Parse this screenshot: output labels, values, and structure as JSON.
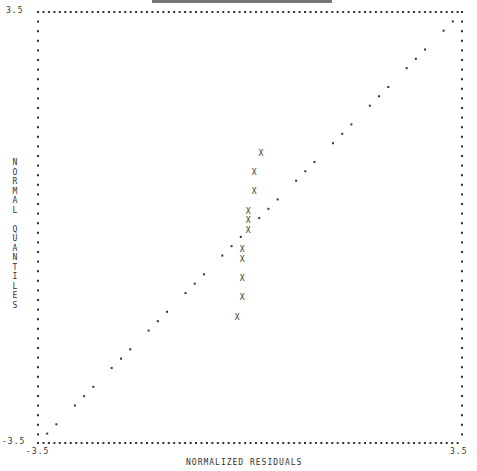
{
  "chart_data": {
    "type": "scatter",
    "title": "",
    "xlabel": "NORMALIZED RESIDUALS",
    "ylabel": "NORMAL QUANTILES",
    "xlim": [
      -3.5,
      3.5
    ],
    "ylim": [
      -3.5,
      3.5
    ],
    "grid": false,
    "legend": null,
    "tick_labels": {
      "y_top": "3.5",
      "y_bottom": "-3.5",
      "x_left": "-3.5",
      "x_right": "3.5"
    },
    "series": [
      {
        "name": "residuals",
        "marker": "X",
        "points": [
          {
            "x": 0.18,
            "y": 1.21
          },
          {
            "x": 0.07,
            "y": 0.9
          },
          {
            "x": 0.07,
            "y": 0.59
          },
          {
            "x": -0.03,
            "y": 0.27
          },
          {
            "x": -0.03,
            "y": 0.12
          },
          {
            "x": -0.03,
            "y": -0.04
          },
          {
            "x": -0.13,
            "y": -0.35
          },
          {
            "x": -0.13,
            "y": -0.51
          },
          {
            "x": -0.13,
            "y": -0.82
          },
          {
            "x": -0.13,
            "y": -1.13
          },
          {
            "x": -0.21,
            "y": -1.45
          }
        ]
      },
      {
        "name": "reference line y=x",
        "marker": "dot",
        "from": [
          -3.5,
          -3.5
        ],
        "to": [
          3.5,
          3.5
        ]
      }
    ]
  },
  "labels": {
    "y_top": "3.5",
    "y_bottom": "-3.5",
    "x_left": "-3.5",
    "x_right": "3.5",
    "xlabel": "NORMALIZED RESIDUALS",
    "ylabel": "N\nO\nR\nM\nA\nL\n\nQ\nU\nA\nN\nT\nI\nL\nE\nS"
  }
}
